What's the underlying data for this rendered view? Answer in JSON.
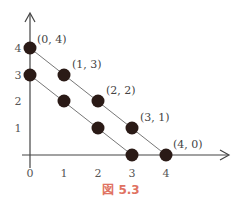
{
  "figure": {
    "caption": "図 5.3",
    "caption_color": "#e07262",
    "x_ticks": [
      "0",
      "1",
      "2",
      "3",
      "4"
    ],
    "y_ticks": [
      "1",
      "2",
      "3",
      "4"
    ],
    "upper_line_points": [
      {
        "x": 0,
        "y": 4,
        "label": "(0, 4)"
      },
      {
        "x": 1,
        "y": 3,
        "label": "(1, 3)"
      },
      {
        "x": 2,
        "y": 2,
        "label": "(2, 2)"
      },
      {
        "x": 3,
        "y": 1,
        "label": "(3, 1)"
      },
      {
        "x": 4,
        "y": 0,
        "label": "(4, 0)"
      }
    ],
    "lower_line_points": [
      {
        "x": 0,
        "y": 3
      },
      {
        "x": 1,
        "y": 2
      },
      {
        "x": 2,
        "y": 1
      },
      {
        "x": 3,
        "y": 0
      }
    ],
    "dot_color": "#2a1a16",
    "line_color": "#666666"
  }
}
